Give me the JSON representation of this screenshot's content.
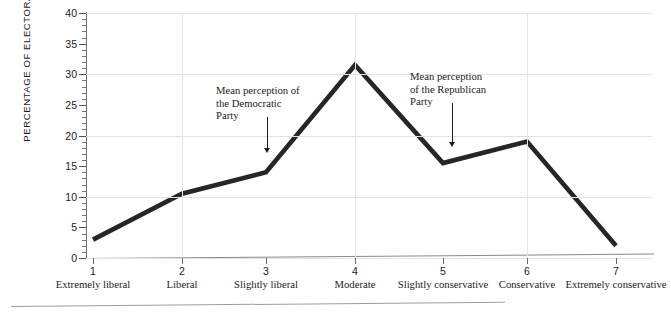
{
  "chart_data": {
    "type": "line",
    "title": "",
    "xlabel": "",
    "ylabel": "PERCENTAGE OF ELECTORATE",
    "ylim": [
      0,
      40
    ],
    "ytick_step": 5,
    "yticks": [
      "0",
      "5",
      "10",
      "15",
      "20",
      "25",
      "30",
      "35",
      "40"
    ],
    "grid": "horizontal gridlines every 10 units, faint vertical gridlines at categories 2, 4, 6",
    "legend": "none",
    "categories": [
      "Extremely liberal",
      "Liberal",
      "Slightly liberal",
      "Moderate",
      "Slightly conservative",
      "Conservative",
      "Extremely conservative"
    ],
    "category_numbers": [
      "1",
      "2",
      "3",
      "4",
      "5",
      "6",
      "7"
    ],
    "values": [
      3,
      10.5,
      14,
      31.5,
      15.5,
      19,
      2
    ],
    "line_color": "#262626",
    "line_width": 4.6,
    "annotations": [
      {
        "text": "Mean perception of\nthe Democratic\nParty",
        "points_to_category": "3",
        "points_to_value": 14,
        "arrow": "down"
      },
      {
        "text": "Mean perception\nof the Republican\nParty",
        "points_to_category": "5",
        "points_to_value": 15.5,
        "arrow": "down"
      }
    ]
  },
  "axes": {
    "y_title": "PERCENTAGE OF ELECTORATE"
  }
}
